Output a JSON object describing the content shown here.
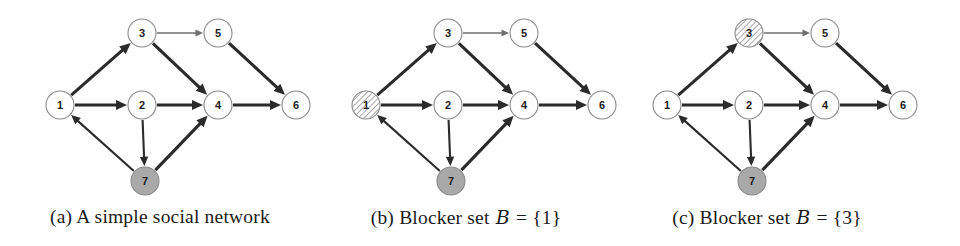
{
  "figure": {
    "background_color": "#ffffff",
    "width": 960,
    "height": 246
  },
  "style": {
    "node_stroke": "#8a8a8a",
    "node_fill_plain": "#ffffff",
    "node_fill_seed": "#a9a9a9",
    "node_fill_blocker": "#ffffff",
    "node_hatch_color": "#8d8d8d",
    "edge_color": "#2b2b2b",
    "edge_color_light": "#6f6f6f",
    "label_color": "#1c1c1c",
    "caption_color": "#1b1b1b",
    "node_radius": 14
  },
  "graph": {
    "nodes": [
      {
        "id": "1",
        "label": "1",
        "x": 60,
        "y": 105
      },
      {
        "id": "2",
        "label": "2",
        "x": 142,
        "y": 105
      },
      {
        "id": "3",
        "label": "3",
        "x": 142,
        "y": 33
      },
      {
        "id": "4",
        "label": "4",
        "x": 218,
        "y": 105
      },
      {
        "id": "5",
        "label": "5",
        "x": 218,
        "y": 33
      },
      {
        "id": "6",
        "label": "6",
        "x": 296,
        "y": 105
      },
      {
        "id": "7",
        "label": "7",
        "x": 145,
        "y": 181
      }
    ],
    "edges": [
      {
        "from": "1",
        "to": "3",
        "weight": "heavy"
      },
      {
        "from": "1",
        "to": "2",
        "weight": "heavy"
      },
      {
        "from": "3",
        "to": "5",
        "weight": "light"
      },
      {
        "from": "3",
        "to": "4",
        "weight": "heavy"
      },
      {
        "from": "5",
        "to": "6",
        "weight": "heavy"
      },
      {
        "from": "2",
        "to": "4",
        "weight": "heavy"
      },
      {
        "from": "4",
        "to": "6",
        "weight": "heavy"
      },
      {
        "from": "2",
        "to": "7",
        "weight": "medium"
      },
      {
        "from": "7",
        "to": "1",
        "weight": "medium"
      },
      {
        "from": "7",
        "to": "4",
        "weight": "heavy"
      }
    ]
  },
  "panels": [
    {
      "key": "a",
      "offset_x": 0,
      "width": 320,
      "caption_prefix": "(a)",
      "caption_text": "A simple social network",
      "caption_full": "(a) A simple social network",
      "caption_has_math": false,
      "seed_nodes": [
        "7"
      ],
      "blocker_nodes": []
    },
    {
      "key": "b",
      "offset_x": 306,
      "width": 320,
      "caption_prefix": "(b)",
      "caption_text": "Blocker set",
      "caption_symbol": "B",
      "caption_equals": "=",
      "caption_set": "{1}",
      "caption_full": "(b) Blocker set ℬ = {1}",
      "caption_has_math": true,
      "seed_nodes": [
        "7"
      ],
      "blocker_nodes": [
        "1"
      ]
    },
    {
      "key": "c",
      "offset_x": 607,
      "width": 320,
      "caption_prefix": "(c)",
      "caption_text": "Blocker set",
      "caption_symbol": "B",
      "caption_equals": "=",
      "caption_set": "{3}",
      "caption_full": "(c) Blocker set ℬ = {3}",
      "caption_has_math": true,
      "seed_nodes": [
        "7"
      ],
      "blocker_nodes": [
        "3"
      ]
    }
  ]
}
